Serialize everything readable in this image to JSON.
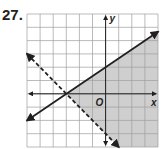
{
  "problem_number": "27.",
  "chart_data": {
    "type": "line",
    "title": "",
    "xlabel": "x",
    "ylabel": "y",
    "origin_label": "O",
    "xlim": [
      -6,
      4
    ],
    "ylim": [
      -4,
      6
    ],
    "grid": true,
    "grid_step": 1,
    "series": [
      {
        "name": "boundary-solid",
        "style": "solid",
        "equation": "y = (2/3)x + 2",
        "points": [
          [
            -6,
            -2
          ],
          [
            4,
            4.667
          ]
        ],
        "passes_through": [
          [
            -3,
            0
          ],
          [
            0,
            2
          ]
        ]
      },
      {
        "name": "boundary-dashed",
        "style": "dashed",
        "equation": "y = -x - 3",
        "points": [
          [
            -6,
            3
          ],
          [
            1,
            -4
          ]
        ],
        "passes_through": [
          [
            -3,
            0
          ],
          [
            0,
            -3
          ]
        ]
      }
    ],
    "shaded_region": "below solid line and above dashed line (right wedge)",
    "colors": {
      "line": "#231f20",
      "grid": "#9d9d9d",
      "shade": "#cfcfcf"
    }
  }
}
